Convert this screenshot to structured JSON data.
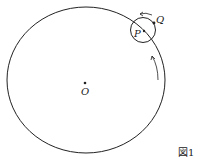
{
  "diagram": {
    "labels": {
      "O": "O",
      "P": "P",
      "Q": "Q"
    },
    "caption": "図1",
    "colors": {
      "stroke": "#222222"
    }
  }
}
